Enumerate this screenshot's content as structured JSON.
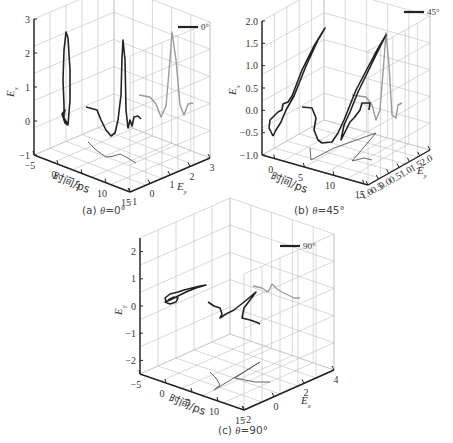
{
  "figure": {
    "panels": [
      {
        "id": "a",
        "caption_prefix": "(a) ",
        "caption_var": "θ",
        "caption_suffix": "=0°"
      },
      {
        "id": "b",
        "caption_prefix": "(b) ",
        "caption_var": "θ",
        "caption_suffix": "=45°"
      },
      {
        "id": "c",
        "caption_prefix": "(c) ",
        "caption_var": "θ",
        "caption_suffix": "=90°"
      }
    ]
  },
  "colors": {
    "main_curve": "#222222",
    "projection_back": "#9a9a9a",
    "projection_floor": "#666666",
    "grid": "#bdbdbd",
    "axis": "#222222"
  },
  "chart_data": [
    {
      "type": "line3d",
      "title": "(a) θ=0°",
      "legend": "0°",
      "xlabel": "时间/ps",
      "ylabel": "E_y",
      "zlabel": "E_x",
      "x_ticks": [
        "-5",
        "0",
        "5",
        "10",
        "15"
      ],
      "y_ticks": [
        "-1",
        "0",
        "1",
        "2",
        "3"
      ],
      "z_ticks": [
        "-1",
        "0",
        "1",
        "2",
        "3"
      ],
      "xlim": [
        -5,
        15
      ],
      "ylim": [
        -1,
        3
      ],
      "zlim": [
        -1.5,
        3
      ],
      "series": [
        {
          "name": "trajectory (E_x vs E_y vs t)",
          "t": [
            -2,
            -1.5,
            -1,
            -0.5,
            0,
            0.5,
            1,
            2,
            4,
            6,
            8,
            10,
            12,
            14
          ],
          "Ey": [
            -0.8,
            -0.7,
            -0.6,
            -0.4,
            -0.2,
            0.0,
            0.2,
            0.6,
            0.5,
            0.3,
            0.1,
            0.0,
            0.0,
            0.0
          ],
          "Ex": [
            0.0,
            -0.5,
            -0.2,
            1.5,
            2.7,
            1.0,
            -0.3,
            0.2,
            -0.3,
            -0.8,
            2.5,
            -0.7,
            -0.3,
            -0.3
          ]
        }
      ]
    },
    {
      "type": "line3d",
      "title": "(b) θ=45°",
      "legend": "45°",
      "xlabel": "时间/ps",
      "ylabel": "E_y",
      "zlabel": "E_x",
      "x_ticks": [
        "0",
        "5",
        "10",
        "15"
      ],
      "y_ticks": [
        "-1.0",
        "-0.5",
        "0.0",
        "0.5",
        "1.0",
        "1.5",
        "2.0"
      ],
      "z_ticks": [
        "-1.0",
        "-0.5",
        "0.0",
        "0.5",
        "1.0",
        "1.5",
        "2.0"
      ],
      "xlim": [
        -2,
        15
      ],
      "ylim": [
        -1,
        2
      ],
      "zlim": [
        -1,
        2
      ],
      "series": [
        {
          "name": "trajectory",
          "t": [
            -1,
            0,
            1,
            2,
            4,
            6,
            8,
            10,
            12,
            14
          ],
          "Ey": [
            -0.5,
            0.0,
            1.8,
            0.0,
            -0.6,
            -0.8,
            1.8,
            0.2,
            -0.2,
            -0.2
          ],
          "Ex": [
            -0.5,
            0.0,
            1.8,
            0.0,
            -0.6,
            -0.8,
            1.8,
            0.2,
            -0.2,
            -0.2
          ]
        }
      ]
    },
    {
      "type": "line3d",
      "title": "(c) θ=90°",
      "legend": "90°",
      "xlabel": "时间/ps",
      "ylabel": "E_x",
      "zlabel": "E_y",
      "x_ticks": [
        "-5",
        "0",
        "5",
        "10",
        "15"
      ],
      "y_ticks": [
        "-2",
        "0",
        "2",
        "4"
      ],
      "z_ticks": [
        "-2",
        "-1",
        "0",
        "1",
        "2"
      ],
      "xlim": [
        -5,
        15
      ],
      "ylim": [
        -2,
        5
      ],
      "zlim": [
        -2.5,
        2.5
      ],
      "series": [
        {
          "name": "trajectory",
          "t": [
            -1,
            0,
            1,
            2,
            4,
            6,
            8,
            10,
            12,
            14
          ],
          "Ex": [
            0.0,
            -1.0,
            0.5,
            2.5,
            0.5,
            0.0,
            3.0,
            0.0,
            1.0,
            1.0
          ],
          "Ey": [
            0.2,
            0.3,
            0.5,
            0.8,
            0.3,
            0.0,
            0.8,
            0.1,
            -0.2,
            -0.2
          ]
        }
      ]
    }
  ]
}
